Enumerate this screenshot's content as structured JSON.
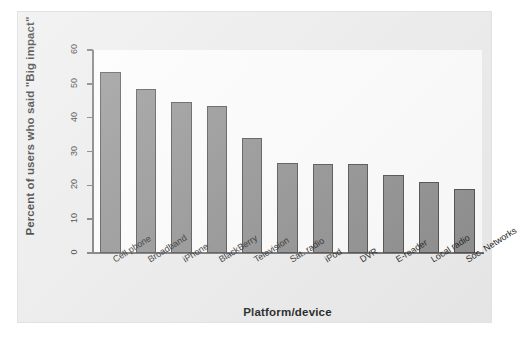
{
  "chart_data": {
    "type": "bar",
    "title": "",
    "xlabel": "Platform/device",
    "ylabel": "Percent of users who said \"Big impact\"",
    "categories": [
      "Cell phone",
      "Broadband",
      "iPhone",
      "BlackBerry",
      "Television",
      "Sat. radio",
      "iPod",
      "DVR",
      "E-reader",
      "Local radio",
      "Soc. Networks"
    ],
    "values": [
      53.5,
      48.5,
      44.5,
      43.5,
      34.0,
      26.6,
      26.4,
      26.2,
      23.2,
      21.0,
      19.0
    ],
    "ylim": [
      0,
      60
    ],
    "yticks": [
      0,
      10,
      20,
      30,
      40,
      50,
      60
    ],
    "grid": false,
    "legend": null,
    "bar_color": "#8c8c8c",
    "bar_edge_color": "#4a4a4a",
    "axis_color": "#6f6f6f",
    "page_color": "#ececed",
    "plot_bg_color": "#fdfdfd"
  }
}
